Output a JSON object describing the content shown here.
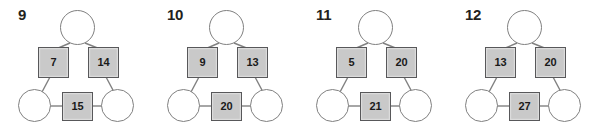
{
  "worksheet": {
    "background_color": "#ffffff",
    "box_fill_color": "#c9c9c9",
    "box_border_color": "#58585a",
    "circle_border_color": "#808080",
    "number_color": "#231f20"
  },
  "puzzles": [
    {
      "label": "9",
      "top_left_value": "7",
      "top_right_value": "14",
      "bottom_value": "15"
    },
    {
      "label": "10",
      "top_left_value": "9",
      "top_right_value": "13",
      "bottom_value": "20"
    },
    {
      "label": "11",
      "top_left_value": "5",
      "top_right_value": "20",
      "bottom_value": "21"
    },
    {
      "label": "12",
      "top_left_value": "13",
      "top_right_value": "20",
      "bottom_value": "27"
    }
  ]
}
